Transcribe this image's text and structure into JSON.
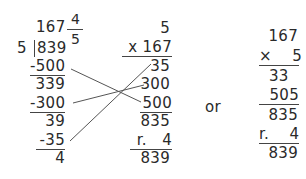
{
  "division": {
    "quotient": "167",
    "fraction_numerator": "4",
    "fraction_denominator": "5",
    "divisor": "5",
    "dividend": "839",
    "steps": [
      {
        "subtract": "-500",
        "result": "339"
      },
      {
        "subtract": "-300",
        "result": "39"
      },
      {
        "subtract": "-35",
        "result": "4"
      }
    ]
  },
  "check_multiplication": {
    "top": "5",
    "multiplier": "x 167",
    "partials": [
      "35",
      "300",
      "500"
    ],
    "sum": "835",
    "remainder": "r.   4",
    "total": "839"
  },
  "separator_word": "or",
  "alt_multiplication": {
    "top": "167",
    "multiplier": "×    5",
    "partial_1": "33",
    "partial_2": "505",
    "sum": "835",
    "remainder": "r.    4",
    "total": "839"
  }
}
